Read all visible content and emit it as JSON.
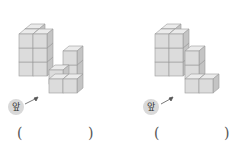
{
  "figures": [
    {
      "front_label": "앞",
      "answer_open": "(",
      "answer_close": ")",
      "answer_value": ""
    },
    {
      "front_label": "앞",
      "answer_open": "(",
      "answer_close": ")",
      "answer_value": ""
    }
  ],
  "colors": {
    "front_face": "#dcdcdc",
    "top_face": "#ebebeb",
    "side_face": "#c4c4c4",
    "edge": "#9a9a9a",
    "badge": "#d9d9d9"
  }
}
